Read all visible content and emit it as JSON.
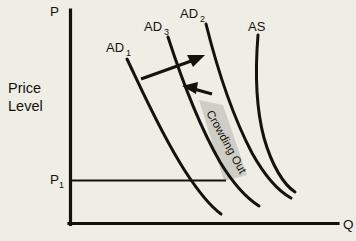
{
  "diagram": {
    "type": "economics-ad-as-diagram",
    "background_color": "#efeee4",
    "ink_color": "#14120c",
    "band_color": "#cfcec6",
    "axes": {
      "y_axis_top_label": "P",
      "x_axis_end_label": "Q",
      "y_axis_name_line1": "Price",
      "y_axis_name_line2": "Level",
      "price_level_tick_label": "P",
      "price_level_tick_sub": "1"
    },
    "curves": [
      {
        "id": "ad1",
        "base": "AD",
        "sub": "1",
        "label": "AD₁",
        "kind": "aggregate-demand"
      },
      {
        "id": "ad3",
        "base": "AD",
        "sub": "3",
        "label": "AD₃",
        "kind": "aggregate-demand"
      },
      {
        "id": "ad2",
        "base": "AD",
        "sub": "2",
        "label": "AD₂",
        "kind": "aggregate-demand"
      },
      {
        "id": "as",
        "base": "AS",
        "sub": "",
        "label": "AS",
        "kind": "aggregate-supply"
      }
    ],
    "annotations": {
      "crowding_out_label": "Crowding Out",
      "crowding_out_rotation_deg": 61,
      "arrow_right_name": "expansion-arrow",
      "arrow_left_name": "crowding-out-arrow"
    }
  }
}
